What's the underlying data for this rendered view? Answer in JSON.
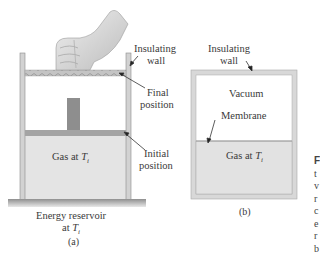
{
  "figure_a": {
    "labels": {
      "insulating_wall_line1": "Insulating",
      "insulating_wall_line2": "wall",
      "final_position_line1": "Final",
      "final_position_line2": "position",
      "initial_position_line1": "Initial",
      "initial_position_line2": "position",
      "gas": "Gas at ",
      "gas_var": "T",
      "gas_sub": "i",
      "reservoir_line1": "Energy reservoir",
      "reservoir_line2": "at ",
      "reservoir_var": "T",
      "reservoir_sub": "i"
    },
    "caption": "(a)"
  },
  "figure_b": {
    "labels": {
      "insulating_wall_line1": "Insulating",
      "insulating_wall_line2": "wall",
      "vacuum": "Vacuum",
      "membrane": "Membrane",
      "gas": "Gas at ",
      "gas_var": "T",
      "gas_sub": "i"
    },
    "caption": "(b)"
  },
  "side_text_fragments": [
    "F",
    "t",
    "v",
    "r",
    "c",
    "e",
    "r",
    "b"
  ],
  "colors": {
    "gas_fill": "#e2e2e2",
    "wall": "#c8c8c8",
    "piston": "#a6a6a6",
    "block": "#8e8e8e",
    "ground": "#9a9a9a"
  }
}
